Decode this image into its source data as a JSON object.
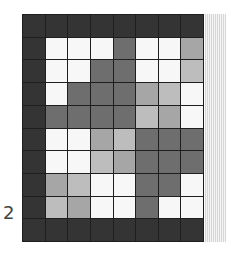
{
  "board": {
    "rows": 10,
    "cols": 8,
    "palette": {
      "D": "#343434",
      "M": "#6e6e6e",
      "L": "#a6a6a6",
      "V": "#bdbdbd",
      "W": "#f7f7f7"
    },
    "cells": [
      [
        "D",
        "D",
        "D",
        "D",
        "D",
        "D",
        "D",
        "D"
      ],
      [
        "D",
        "W",
        "W",
        "W",
        "M",
        "W",
        "W",
        "L"
      ],
      [
        "D",
        "W",
        "W",
        "M",
        "M",
        "W",
        "W",
        "V"
      ],
      [
        "D",
        "W",
        "M",
        "M",
        "M",
        "L",
        "V",
        "W"
      ],
      [
        "D",
        "M",
        "M",
        "M",
        "M",
        "V",
        "L",
        "W"
      ],
      [
        "D",
        "W",
        "W",
        "L",
        "V",
        "M",
        "M",
        "M"
      ],
      [
        "D",
        "W",
        "W",
        "V",
        "L",
        "M",
        "M",
        "M"
      ],
      [
        "D",
        "L",
        "V",
        "W",
        "W",
        "M",
        "M",
        "W"
      ],
      [
        "D",
        "V",
        "L",
        "W",
        "W",
        "M",
        "W",
        "W"
      ],
      [
        "D",
        "D",
        "D",
        "D",
        "D",
        "D",
        "D",
        "D"
      ]
    ]
  },
  "row_label": "2"
}
